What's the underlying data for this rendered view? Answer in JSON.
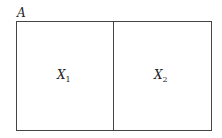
{
  "diagram": {
    "set_label": "A",
    "partitions": [
      {
        "symbol": "X",
        "subscript": "1"
      },
      {
        "symbol": "X",
        "subscript": "2"
      }
    ]
  }
}
